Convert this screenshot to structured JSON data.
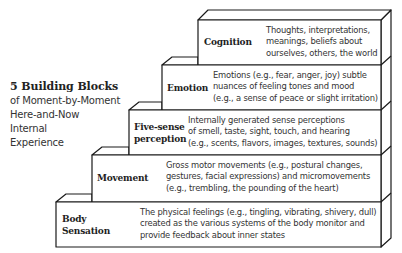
{
  "side_title": {
    "heading": "5 Building Blocks",
    "lines": [
      "of Moment-by-Moment",
      "Here-and-Now",
      "Internal",
      "Experience"
    ]
  },
  "blocks": [
    {
      "label_lines": [
        "Cognition"
      ],
      "desc_lines": [
        "Thoughts, interpretations,",
        "meanings, beliefs about",
        "ourselves, others, the world"
      ]
    },
    {
      "label_lines": [
        "Emotion"
      ],
      "desc_lines": [
        "Emotions (e.g., fear, anger, joy) subtle",
        "nuances of feeling tones and mood",
        "(e.g., a sense of peace or slight irritation)"
      ]
    },
    {
      "label_lines": [
        "Five-sense",
        "perception"
      ],
      "desc_lines": [
        "Internally generated sense perceptions",
        "of smell, taste, sight, touch, and hearing",
        "(e.g., scents, flavors, images, textures, sounds)"
      ]
    },
    {
      "label_lines": [
        "Movement"
      ],
      "desc_lines": [
        "Gross motor movements (e.g., postural changes,",
        "gestures, facial expressions) and micromovements",
        "(e.g., trembling, the pounding of the heart)"
      ]
    },
    {
      "label_lines": [
        "Body",
        "Sensation"
      ],
      "desc_lines": [
        "The physical feelings (e.g., tingling, vibrating, shivery, dull)",
        "created as the various systems of the body monitor and",
        "provide feedback about inner states"
      ]
    }
  ],
  "colors": {
    "stroke": "#1a1a1a",
    "fill": "#ffffff",
    "text": "#2a2a2a"
  }
}
